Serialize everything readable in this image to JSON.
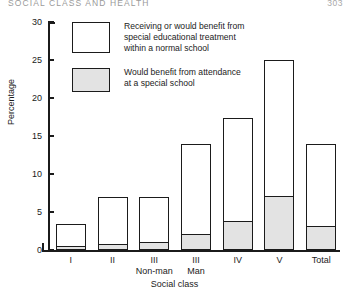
{
  "header": {
    "running_head": "SOCIAL CLASS AND HEALTH",
    "folio": "303"
  },
  "legend": {
    "position": "inside-top-left",
    "items": [
      {
        "key": "normal-school",
        "label": "Receiving or would benefit from\nspecial educational treatment\nwithin a normal school",
        "swatch": "open"
      },
      {
        "key": "special-school",
        "label": "Would benefit from attendance\nat a special school",
        "swatch": "shaded"
      }
    ]
  },
  "chart_data": {
    "type": "bar",
    "stacked": true,
    "title": "",
    "xlabel": "Social class",
    "ylabel": "Percentage",
    "ylim": [
      0,
      30
    ],
    "yticks": [
      0,
      5,
      10,
      15,
      20,
      25,
      30
    ],
    "ytick_labels": [
      "0",
      "5",
      "10",
      "15",
      "20",
      "25",
      "30"
    ],
    "grid": false,
    "categories": [
      "I",
      "II",
      "III\nNon-man",
      "III\nMan",
      "IV",
      "V",
      "Total"
    ],
    "category_labels": [
      {
        "line1": "I",
        "line2": ""
      },
      {
        "line1": "II",
        "line2": ""
      },
      {
        "line1": "III",
        "line2": "Non-man"
      },
      {
        "line1": "III",
        "line2": "Man"
      },
      {
        "line1": "IV",
        "line2": ""
      },
      {
        "line1": "V",
        "line2": ""
      },
      {
        "line1": "Total",
        "line2": ""
      }
    ],
    "series": [
      {
        "name": "Receiving or would benefit from special educational treatment within a normal school",
        "swatch": "open",
        "color": "#ffffff",
        "values": [
          3.4,
          7.0,
          7.0,
          14.0,
          17.4,
          25.0,
          14.0
        ],
        "note": "values are bar totals (outer outline)"
      },
      {
        "name": "Would benefit from attendance at a special school",
        "swatch": "shaded",
        "color": "#e3e3e3",
        "values": [
          0.4,
          0.7,
          0.9,
          2.0,
          3.7,
          7.0,
          3.0
        ],
        "note": "shaded portion measured from zero"
      }
    ]
  },
  "colors": {
    "ink": "#1b1b1b",
    "shaded_fill": "#e3e3e3",
    "open_fill": "#ffffff",
    "paper": "#ffffff"
  }
}
